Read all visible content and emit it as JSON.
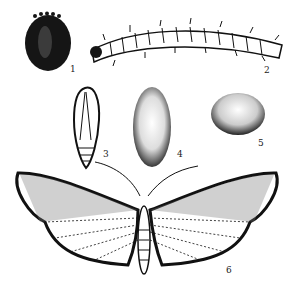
{
  "figure": {
    "ink_color": "#111111",
    "background": "#ffffff",
    "stages": [
      {
        "id": 1,
        "label": "1",
        "name": "egg"
      },
      {
        "id": 2,
        "label": "2",
        "name": "larva"
      },
      {
        "id": 3,
        "label": "3",
        "name": "pupa"
      },
      {
        "id": 4,
        "label": "4",
        "name": "cocoon"
      },
      {
        "id": 5,
        "label": "5",
        "name": "cocoon-or-egg-mass"
      },
      {
        "id": 6,
        "label": "6",
        "name": "adult-moth"
      }
    ]
  }
}
